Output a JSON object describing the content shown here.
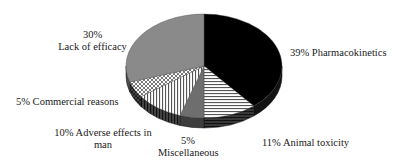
{
  "chart_data": {
    "type": "pie",
    "style": "3d-exploded-none",
    "title": "",
    "start_angle": "12 o'clock",
    "direction": "clockwise",
    "slices": [
      {
        "label": "Pharmacokinetics",
        "value": 39,
        "fill": "#000000",
        "pattern": "solid"
      },
      {
        "label": "Animal toxicity",
        "value": 11,
        "fill": "#ffffff",
        "pattern": "horizontal-lines"
      },
      {
        "label": "Miscellaneous",
        "value": 5,
        "fill": "#6e6e6e",
        "pattern": "solid"
      },
      {
        "label": "Adverse effects in man",
        "value": 10,
        "fill": "#ffffff",
        "pattern": "vertical-lines"
      },
      {
        "label": "Commercial reasons",
        "value": 5,
        "fill": "#ffffff",
        "pattern": "crosshatch"
      },
      {
        "label": "Lack of efficacy",
        "value": 30,
        "fill": "#8a8a8a",
        "pattern": "solid"
      }
    ],
    "legend": "none (direct labels)"
  },
  "labels": {
    "pharmacokinetics": "39% Pharmacokinetics",
    "animal_toxicity": "11% Animal toxicity",
    "misc_pct": "5%",
    "misc_name": "Miscellaneous",
    "adverse_line1": "10% Adverse effects in",
    "adverse_line2": "man",
    "commercial": "5% Commercial reasons",
    "efficacy_pct": "30%",
    "efficacy_name": "Lack of efficacy"
  }
}
